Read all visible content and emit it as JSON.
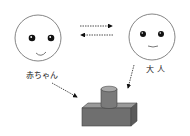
{
  "diagram": {
    "baby": {
      "label": "赤ちゃん"
    },
    "adult": {
      "label": "大 人"
    },
    "object": {
      "name": "block-with-cylinder"
    },
    "colors": {
      "stroke": "#555555",
      "eye": "#111111",
      "object_front": "#6f6f6f",
      "object_top": "#9a9a9a",
      "object_side": "#5a5a5a",
      "cylinder_body": "#7a7a7a",
      "cylinder_top": "#a8a8a8"
    },
    "arrows": [
      {
        "from": "baby",
        "to": "adult",
        "style": "dashed"
      },
      {
        "from": "adult",
        "to": "baby",
        "style": "dashed"
      },
      {
        "from": "baby",
        "to": "object",
        "style": "dashed"
      },
      {
        "from": "adult",
        "to": "object",
        "style": "dashed"
      }
    ]
  }
}
